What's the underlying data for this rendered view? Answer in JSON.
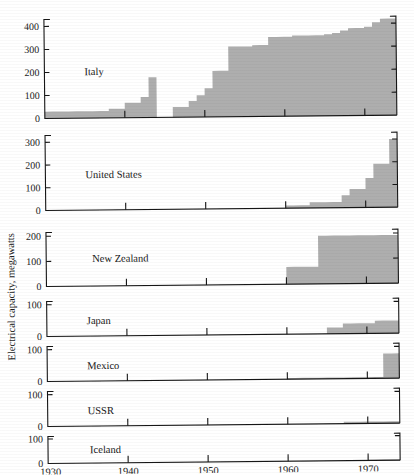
{
  "figure": {
    "ylabel": "Electrical capacity, megawatts",
    "xtick_labels": [
      "1930",
      "1940",
      "1950",
      "1960",
      "1970"
    ],
    "xtick_values": [
      1930,
      1940,
      1950,
      1960,
      1970
    ],
    "fill_color": "#aeaeae",
    "axis_color": "#161616",
    "background": "#ffffff"
  },
  "chart_data": {
    "type": "area",
    "title": "",
    "subtitle": "",
    "xlabel": "",
    "ylabel": "Electrical capacity, megawatts",
    "xlim": [
      1930,
      1974
    ],
    "grid": false,
    "legend": "none",
    "x": [
      1930,
      1931,
      1932,
      1933,
      1934,
      1935,
      1936,
      1937,
      1938,
      1939,
      1940,
      1941,
      1942,
      1943,
      1944,
      1945,
      1946,
      1947,
      1948,
      1949,
      1950,
      1951,
      1952,
      1953,
      1954,
      1955,
      1956,
      1957,
      1958,
      1959,
      1960,
      1961,
      1962,
      1963,
      1964,
      1965,
      1966,
      1967,
      1968,
      1969,
      1970,
      1971,
      1972,
      1973
    ],
    "panels": [
      {
        "name": "Italy",
        "label": "Italy",
        "ylim": [
          0,
          430
        ],
        "yticks": [
          0,
          100,
          200,
          300,
          400
        ],
        "ytick_labels": [
          "0",
          "100",
          "200",
          "300",
          "400"
        ],
        "values": [
          30,
          30,
          30,
          30,
          30,
          30,
          30,
          30,
          40,
          40,
          65,
          65,
          90,
          175,
          0,
          0,
          45,
          45,
          70,
          95,
          125,
          200,
          200,
          305,
          305,
          305,
          310,
          310,
          345,
          345,
          345,
          350,
          350,
          350,
          350,
          355,
          360,
          370,
          380,
          380,
          385,
          405,
          420,
          420
        ]
      },
      {
        "name": "United States",
        "label": "United States",
        "ylim": [
          0,
          330
        ],
        "yticks": [
          0,
          100,
          200,
          300
        ],
        "ytick_labels": [
          "0",
          "100",
          "200",
          "300"
        ],
        "values": [
          0,
          0,
          0,
          0,
          0,
          0,
          0,
          0,
          0,
          0,
          0,
          0,
          0,
          0,
          0,
          0,
          0,
          0,
          0,
          0,
          0,
          0,
          0,
          0,
          0,
          0,
          0,
          0,
          0,
          0,
          12,
          12,
          12,
          25,
          25,
          25,
          25,
          55,
          82,
          82,
          130,
          192,
          192,
          300
        ]
      },
      {
        "name": "New Zealand",
        "label": "New Zealand",
        "ylim": [
          0,
          215
        ],
        "yticks": [
          0,
          100,
          200
        ],
        "ytick_labels": [
          "0",
          "100",
          "200"
        ],
        "values": [
          0,
          0,
          0,
          0,
          0,
          0,
          0,
          0,
          0,
          0,
          0,
          0,
          0,
          0,
          0,
          0,
          0,
          0,
          0,
          0,
          0,
          0,
          0,
          0,
          0,
          0,
          0,
          0,
          0,
          0,
          69,
          69,
          69,
          69,
          192,
          192,
          192,
          192,
          192,
          192,
          192,
          192,
          192,
          192
        ]
      },
      {
        "name": "Japan",
        "label": "Japan",
        "ylim": [
          0,
          110
        ],
        "yticks": [
          0,
          100
        ],
        "ytick_labels": [
          "0",
          "100"
        ],
        "values": [
          0,
          0,
          0,
          0,
          0,
          0,
          0,
          0,
          0,
          0,
          0,
          0,
          0,
          0,
          0,
          0,
          0,
          0,
          0,
          0,
          0,
          0,
          0,
          0,
          0,
          0,
          0,
          0,
          0,
          0,
          0,
          0,
          0,
          0,
          0,
          20,
          20,
          32,
          32,
          32,
          32,
          40,
          40,
          40
        ]
      },
      {
        "name": "Mexico",
        "label": "Mexico",
        "ylim": [
          0,
          110
        ],
        "yticks": [
          0,
          100
        ],
        "ytick_labels": [
          "0",
          "100"
        ],
        "values": [
          0,
          0,
          0,
          0,
          0,
          0,
          0,
          0,
          0,
          0,
          0,
          0,
          0,
          0,
          0,
          0,
          0,
          0,
          0,
          0,
          0,
          0,
          0,
          0,
          0,
          0,
          0,
          0,
          0,
          0,
          4,
          4,
          4,
          4,
          4,
          4,
          4,
          4,
          4,
          4,
          4,
          4,
          78,
          78
        ]
      },
      {
        "name": "USSR",
        "label": "USSR",
        "ylim": [
          0,
          110
        ],
        "yticks": [
          0,
          100
        ],
        "ytick_labels": [
          "0",
          "100"
        ],
        "values": [
          0,
          0,
          0,
          0,
          0,
          0,
          0,
          0,
          0,
          0,
          0,
          0,
          0,
          0,
          0,
          0,
          0,
          0,
          0,
          0,
          0,
          0,
          0,
          0,
          0,
          0,
          0,
          0,
          0,
          0,
          0,
          0,
          0,
          0,
          0,
          0,
          0,
          6,
          6,
          6,
          6,
          6,
          6,
          6
        ]
      },
      {
        "name": "Iceland",
        "label": "Iceland",
        "ylim": [
          0,
          110
        ],
        "yticks": [
          0,
          100
        ],
        "ytick_labels": [
          "0",
          "100"
        ],
        "values": [
          0,
          0,
          0,
          0,
          0,
          0,
          0,
          0,
          0,
          0,
          0,
          0,
          0,
          0,
          0,
          0,
          0,
          0,
          0,
          0,
          0,
          0,
          0,
          0,
          0,
          0,
          0,
          0,
          0,
          0,
          0,
          0,
          0,
          0,
          0,
          0,
          0,
          0,
          0,
          0,
          3,
          3,
          3,
          3
        ]
      }
    ]
  }
}
